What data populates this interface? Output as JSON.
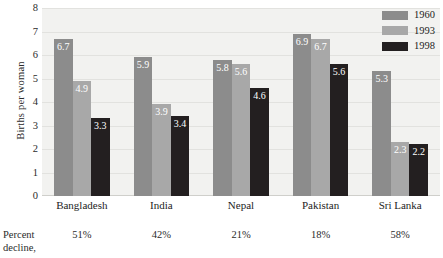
{
  "chart_data": {
    "type": "bar",
    "title": "",
    "subtitle": "",
    "xlabel": "",
    "ylabel": "Births per woman",
    "ylim": [
      0,
      8
    ],
    "ytick_labels": [
      "8",
      "7",
      "6",
      "5",
      "4",
      "3",
      "2",
      "1",
      "0"
    ],
    "yticks": [
      8,
      7,
      6,
      5,
      4,
      3,
      2,
      1,
      0
    ],
    "grid": true,
    "grid_axis": "y",
    "legend_position": "top-right",
    "categories": [
      "Bangladesh",
      "India",
      "Nepal",
      "Pakistan",
      "Sri Lanka"
    ],
    "series": [
      {
        "name": "1960",
        "color": "#8c8c8c",
        "values": [
          6.7,
          5.9,
          5.8,
          6.9,
          5.3
        ],
        "labels": [
          "6.7",
          "5.9",
          "5.8",
          "6.9",
          "5.3"
        ]
      },
      {
        "name": "1993",
        "color": "#a8a8a8",
        "values": [
          4.9,
          3.9,
          5.6,
          6.7,
          2.3
        ],
        "labels": [
          "4.9",
          "3.9",
          "5.6",
          "6.7",
          "2.3"
        ]
      },
      {
        "name": "1998",
        "color": "#231f20",
        "values": [
          3.3,
          3.4,
          4.6,
          5.6,
          2.2
        ],
        "labels": [
          "3.3",
          "3.4",
          "4.6",
          "5.6",
          "2.2"
        ]
      }
    ],
    "annotations": {
      "percent_decline_label": "Percent decline,",
      "percent_decline_values": [
        "51%",
        "42%",
        "21%",
        "18%",
        "58%"
      ]
    },
    "colors": {
      "plot_background": "#f2f2f0",
      "gridline": "#e2e2df",
      "page_background": "#ffffff",
      "text": "#2b2b2b",
      "value_label_text": "#ffffff"
    }
  },
  "legend": {
    "items": [
      {
        "label": "1960",
        "color": "#8c8c8c"
      },
      {
        "label": "1993",
        "color": "#a8a8a8"
      },
      {
        "label": "1998",
        "color": "#231f20"
      }
    ]
  },
  "axes": {
    "y_title": "Births per woman"
  }
}
